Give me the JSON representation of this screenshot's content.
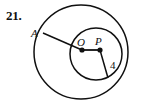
{
  "problem": {
    "number": "21."
  },
  "figure": {
    "type": "geometry-diagram",
    "labels": {
      "point_a": "A",
      "center_o": "O",
      "point_p": "P",
      "length_4": "4"
    },
    "colors": {
      "stroke": "#101010",
      "background": "#ffffff",
      "text": "#101010"
    },
    "shapes": {
      "large_circle": {
        "cx": 81,
        "cy": 52,
        "r": 47
      },
      "small_circle": {
        "cx": 96,
        "cy": 54,
        "r": 26
      },
      "point_o": {
        "x": 82,
        "y": 50,
        "r": 2.6
      },
      "point_p": {
        "x": 100,
        "y": 50,
        "r": 2.6
      },
      "segment_a_to_o": {
        "x1": 43,
        "y1": 33,
        "x2": 82,
        "y2": 50
      },
      "segment_o_to_p": {
        "x1": 82,
        "y1": 50,
        "x2": 100,
        "y2": 50
      },
      "segment_p_to_edge": {
        "x1": 100,
        "y1": 50,
        "x2": 108,
        "y2": 77
      }
    },
    "label_positions": {
      "point_a": {
        "x": 31,
        "y": 36,
        "size": 11
      },
      "center_o": {
        "x": 78,
        "y": 46,
        "size": 11
      },
      "point_p": {
        "x": 96,
        "y": 45,
        "size": 11
      },
      "length_4": {
        "x": 110,
        "y": 68,
        "size": 11
      }
    }
  }
}
